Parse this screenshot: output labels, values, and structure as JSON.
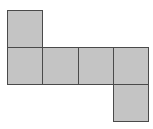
{
  "diagram": {
    "type": "cube-net",
    "fill_color": "#c4c4c4",
    "stroke_color": "#4a4a4a",
    "squares": [
      {
        "id": "top",
        "col": 0,
        "row": 0
      },
      {
        "id": "row1-col0",
        "col": 0,
        "row": 1
      },
      {
        "id": "row1-col1",
        "col": 1,
        "row": 1
      },
      {
        "id": "row1-col2",
        "col": 2,
        "row": 1
      },
      {
        "id": "row1-col3",
        "col": 3,
        "row": 1
      },
      {
        "id": "bottom",
        "col": 3,
        "row": 2
      }
    ]
  }
}
